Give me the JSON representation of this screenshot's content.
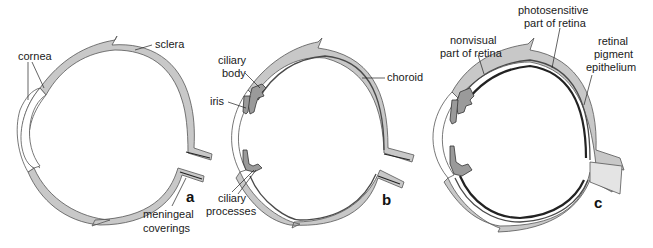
{
  "figure": {
    "colors": {
      "sclera": "#c8c8c8",
      "outline": "#555555",
      "choroid": "#4a4a4a",
      "retina": "#222222",
      "background": "#ffffff"
    },
    "panels": [
      {
        "id": "a",
        "panel_label": "a",
        "labels": {
          "cornea": "cornea",
          "sclera": "sclera",
          "meningeal_1": "meningeal",
          "meningeal_2": "coverings"
        }
      },
      {
        "id": "b",
        "panel_label": "b",
        "labels": {
          "ciliary_body_1": "ciliary",
          "ciliary_body_2": "body",
          "iris": "iris",
          "choroid": "choroid",
          "ciliary_processes_1": "ciliary",
          "ciliary_processes_2": "processes"
        }
      },
      {
        "id": "c",
        "panel_label": "c",
        "labels": {
          "nonvisual_1": "nonvisual",
          "nonvisual_2": "part of retina",
          "photosensitive_1": "photosensitive",
          "photosensitive_2": "part of retina",
          "rpe_1": "retinal",
          "rpe_2": "pigment",
          "rpe_3": "epithelium"
        }
      }
    ]
  }
}
